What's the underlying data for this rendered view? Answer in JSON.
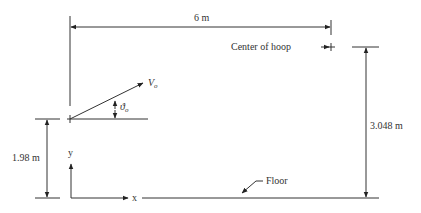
{
  "diagram": {
    "type": "projectile-basketball-setup",
    "labels": {
      "horizontal_distance": "6 m",
      "hoop_label": "Center of hoop",
      "hoop_height": "3.048 m",
      "release_height": "1.98 m",
      "velocity": "V",
      "velocity_sub": "o",
      "angle": "ϑ",
      "angle_sub": "o",
      "floor": "Floor",
      "x_axis": "x",
      "y_axis": "y"
    },
    "colors": {
      "line": "#333333",
      "background": "#ffffff"
    }
  }
}
